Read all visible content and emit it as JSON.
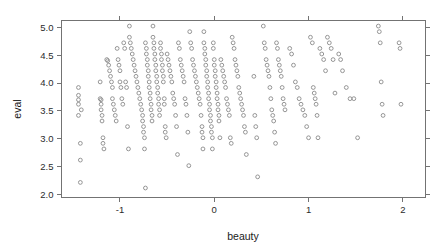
{
  "chart_data": {
    "type": "scatter",
    "title": "",
    "xlabel": "beauty",
    "ylabel": "eval",
    "xlim": [
      -1.62,
      2.24
    ],
    "ylim": [
      1.95,
      5.12
    ],
    "xticks": [
      -1,
      0,
      1,
      2
    ],
    "xtick_labels": [
      "-1",
      "0",
      "1",
      "2"
    ],
    "yticks": [
      2.0,
      2.5,
      3.0,
      3.5,
      4.0,
      4.5,
      5.0
    ],
    "ytick_labels": [
      "2.0",
      "2.5",
      "3.0",
      "3.5",
      "4.0",
      "4.5",
      "5.0"
    ],
    "grid": false,
    "legend": false,
    "marker": "open-circle",
    "marker_color": "#8a8a8a",
    "frame_color": "#737373",
    "n_points": 463,
    "x": [
      -1.44,
      -1.44,
      -1.44,
      -1.44,
      -1.44,
      -1.42,
      -1.42,
      -1.42,
      -1.41,
      -1.21,
      -1.21,
      -1.2,
      -1.2,
      -1.2,
      -1.19,
      -1.19,
      -1.18,
      -1.18,
      -1.17,
      -1.14,
      -1.13,
      -1.12,
      -1.11,
      -1.1,
      -1.09,
      -1.08,
      -1.08,
      -1.07,
      -1.06,
      -1.05,
      -1.04,
      -1.03,
      -1.02,
      -1.01,
      -1.0,
      -1.0,
      -0.99,
      -0.98,
      -0.97,
      -0.96,
      -0.95,
      -0.94,
      -0.93,
      -0.92,
      -0.91,
      -0.9,
      -0.9,
      -0.89,
      -0.88,
      -0.87,
      -0.86,
      -0.85,
      -0.84,
      -0.83,
      -0.82,
      -0.81,
      -0.8,
      -0.79,
      -0.78,
      -0.77,
      -0.76,
      -0.76,
      -0.75,
      -0.75,
      -0.74,
      -0.74,
      -0.73,
      -0.73,
      -0.72,
      -0.72,
      -0.71,
      -0.71,
      -0.7,
      -0.7,
      -0.69,
      -0.69,
      -0.68,
      -0.68,
      -0.67,
      -0.67,
      -0.66,
      -0.66,
      -0.65,
      -0.65,
      -0.64,
      -0.64,
      -0.63,
      -0.63,
      -0.62,
      -0.62,
      -0.61,
      -0.61,
      -0.6,
      -0.6,
      -0.59,
      -0.59,
      -0.58,
      -0.58,
      -0.57,
      -0.57,
      -0.56,
      -0.56,
      -0.55,
      -0.55,
      -0.54,
      -0.54,
      -0.53,
      -0.53,
      -0.52,
      -0.52,
      -0.51,
      -0.5,
      -0.49,
      -0.48,
      -0.47,
      -0.46,
      -0.45,
      -0.44,
      -0.43,
      -0.42,
      -0.41,
      -0.4,
      -0.39,
      -0.38,
      -0.37,
      -0.36,
      -0.35,
      -0.34,
      -0.33,
      -0.32,
      -0.31,
      -0.3,
      -0.29,
      -0.28,
      -0.27,
      -0.26,
      -0.25,
      -0.24,
      -0.23,
      -0.22,
      -0.21,
      -0.2,
      -0.19,
      -0.18,
      -0.17,
      -0.16,
      -0.15,
      -0.14,
      -0.13,
      -0.13,
      -0.12,
      -0.12,
      -0.11,
      -0.11,
      -0.1,
      -0.1,
      -0.09,
      -0.09,
      -0.08,
      -0.08,
      -0.07,
      -0.07,
      -0.06,
      -0.06,
      -0.05,
      -0.05,
      -0.04,
      -0.04,
      -0.03,
      -0.03,
      -0.02,
      -0.02,
      -0.01,
      -0.01,
      0.0,
      0.0,
      0.01,
      0.01,
      0.02,
      0.02,
      0.03,
      0.03,
      0.04,
      0.04,
      0.05,
      0.05,
      0.06,
      0.07,
      0.08,
      0.09,
      0.1,
      0.11,
      0.12,
      0.13,
      0.14,
      0.15,
      0.16,
      0.17,
      0.18,
      0.19,
      0.2,
      0.21,
      0.22,
      0.23,
      0.24,
      0.25,
      0.26,
      0.27,
      0.28,
      0.29,
      0.3,
      0.31,
      0.32,
      0.33,
      0.34,
      0.42,
      0.43,
      0.44,
      0.45,
      0.46,
      0.52,
      0.53,
      0.54,
      0.55,
      0.56,
      0.57,
      0.58,
      0.59,
      0.6,
      0.61,
      0.62,
      0.63,
      0.64,
      0.65,
      0.66,
      0.67,
      0.68,
      0.69,
      0.7,
      0.71,
      0.72,
      0.73,
      0.74,
      0.75,
      0.8,
      0.82,
      0.84,
      0.86,
      0.88,
      0.9,
      0.92,
      0.94,
      0.96,
      0.98,
      1.0,
      1.02,
      1.04,
      1.05,
      1.06,
      1.07,
      1.08,
      1.09,
      1.1,
      1.12,
      1.14,
      1.16,
      1.18,
      1.2,
      1.22,
      1.24,
      1.26,
      1.28,
      1.32,
      1.34,
      1.36,
      1.4,
      1.44,
      1.48,
      1.52,
      1.74,
      1.75,
      1.76,
      1.77,
      1.78,
      1.79,
      1.96,
      1.97,
      1.98
    ],
    "y": [
      3.92,
      3.78,
      3.7,
      3.62,
      3.42,
      2.92,
      2.62,
      2.22,
      3.52,
      4.02,
      3.72,
      3.7,
      3.62,
      3.52,
      3.42,
      3.32,
      3.02,
      2.92,
      2.82,
      4.42,
      4.4,
      4.32,
      4.22,
      4.12,
      4.02,
      3.92,
      3.72,
      3.62,
      3.52,
      3.42,
      3.32,
      4.62,
      4.42,
      4.32,
      4.22,
      4.02,
      3.92,
      3.72,
      3.62,
      4.72,
      4.62,
      4.02,
      3.92,
      3.22,
      2.82,
      5.02,
      4.82,
      4.72,
      4.62,
      4.52,
      4.42,
      4.32,
      4.22,
      4.12,
      4.02,
      3.92,
      3.82,
      3.72,
      3.62,
      3.52,
      3.42,
      3.32,
      3.22,
      3.12,
      3.02,
      2.82,
      2.12,
      4.72,
      4.62,
      4.52,
      4.42,
      4.32,
      4.22,
      4.12,
      4.02,
      3.92,
      3.82,
      3.72,
      3.62,
      3.52,
      3.42,
      3.32,
      5.02,
      4.82,
      4.72,
      4.62,
      4.52,
      4.42,
      4.32,
      4.22,
      4.12,
      4.02,
      3.92,
      3.82,
      3.72,
      3.62,
      3.52,
      3.42,
      4.72,
      4.62,
      4.52,
      4.42,
      4.32,
      4.22,
      4.12,
      4.02,
      3.72,
      3.62,
      3.22,
      3.12,
      3.02,
      4.52,
      4.42,
      4.32,
      4.22,
      4.12,
      4.02,
      3.82,
      3.72,
      3.62,
      3.42,
      3.22,
      2.72,
      4.72,
      4.62,
      4.42,
      4.32,
      4.22,
      4.12,
      4.02,
      3.72,
      3.62,
      3.42,
      3.12,
      2.52,
      4.92,
      4.72,
      4.62,
      4.42,
      4.32,
      4.22,
      4.12,
      4.02,
      3.92,
      3.82,
      3.72,
      3.62,
      3.42,
      3.22,
      3.12,
      3.02,
      2.82,
      4.92,
      4.72,
      4.62,
      4.52,
      4.42,
      4.32,
      4.22,
      4.12,
      4.02,
      3.92,
      3.82,
      3.72,
      3.62,
      3.52,
      3.42,
      3.32,
      3.22,
      3.12,
      3.02,
      2.82,
      4.72,
      4.62,
      4.42,
      4.32,
      4.22,
      4.12,
      4.02,
      3.92,
      3.82,
      3.72,
      3.62,
      3.52,
      3.42,
      3.32,
      3.02,
      4.42,
      4.32,
      4.22,
      4.12,
      4.02,
      3.92,
      3.72,
      3.62,
      3.52,
      3.42,
      3.02,
      2.92,
      4.82,
      4.72,
      4.62,
      4.42,
      4.32,
      4.22,
      4.12,
      3.92,
      3.82,
      3.72,
      3.62,
      3.52,
      3.42,
      3.22,
      3.12,
      2.72,
      4.12,
      3.42,
      3.22,
      3.02,
      2.32,
      5.02,
      4.72,
      4.62,
      4.42,
      4.32,
      4.22,
      4.12,
      3.92,
      3.72,
      3.52,
      3.42,
      3.32,
      3.12,
      2.92,
      4.72,
      4.62,
      4.42,
      4.32,
      4.22,
      4.12,
      3.92,
      3.72,
      3.62,
      3.52,
      4.62,
      4.52,
      4.32,
      4.02,
      3.92,
      3.72,
      3.62,
      3.52,
      3.42,
      3.22,
      3.02,
      4.82,
      4.72,
      3.92,
      3.82,
      3.72,
      3.62,
      3.42,
      3.02,
      4.62,
      4.52,
      4.42,
      4.22,
      4.82,
      4.72,
      4.62,
      4.42,
      3.82,
      4.52,
      4.42,
      4.22,
      3.92,
      3.72,
      3.72,
      3.02,
      5.02,
      4.92,
      4.72,
      4.02,
      3.62,
      3.42,
      4.72,
      4.62,
      3.62,
      3.42
    ]
  },
  "axes": {
    "x_title": "beauty",
    "y_title": "eval"
  }
}
